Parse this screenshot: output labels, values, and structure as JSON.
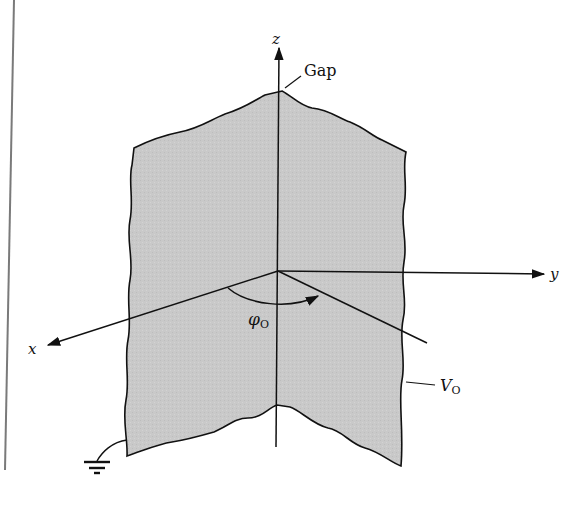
{
  "figure": {
    "colors": {
      "plate_fill": "#c8c8c8",
      "stroke": "#111111",
      "margin_rule": "#7a7a7a"
    }
  },
  "axes": {
    "z_label": "z",
    "y_label": "y",
    "x_label": "x"
  },
  "annotations": {
    "gap_label": "Gap",
    "angle_symbol": "φ",
    "angle_subscript": "O",
    "potential_symbol": "V",
    "potential_subscript": "O"
  },
  "icons": {
    "ground": "ground-symbol-icon"
  }
}
